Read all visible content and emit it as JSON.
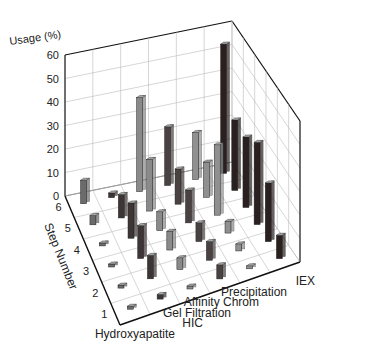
{
  "chart_data": {
    "type": "bar3d",
    "title": "",
    "zlabel": "Usage (%)",
    "ylabel": "Step Number",
    "xlabel": "",
    "z_ticks": [
      "0",
      "10",
      "20",
      "30",
      "40",
      "50",
      "60"
    ],
    "zlim": [
      0,
      60
    ],
    "y_ticks": [
      "1",
      "2",
      "3",
      "4",
      "5",
      "6"
    ],
    "categories": [
      "Hydroxyapatite",
      "HIC",
      "Gel Filtration",
      "Affinity Chrom",
      "Precipitation",
      "IEX"
    ],
    "series": [
      {
        "name": "Hydroxyapatite",
        "color": "#6b6b6b",
        "values": [
          1,
          1,
          1,
          1,
          4,
          10
        ]
      },
      {
        "name": "HIC",
        "color": "#3d3535",
        "values": [
          2,
          10,
          14,
          15,
          10,
          2
        ]
      },
      {
        "name": "Gel Filtration",
        "color": "#8a8a8a",
        "values": [
          1,
          5,
          8,
          8,
          22,
          40
        ]
      },
      {
        "name": "Affinity Chrom",
        "color": "#4a4242",
        "values": [
          6,
          8,
          8,
          14,
          15,
          25
        ]
      },
      {
        "name": "Precipitation",
        "color": "#909090",
        "values": [
          1,
          3,
          5,
          30,
          15,
          20
        ]
      },
      {
        "name": "IEX",
        "color": "#2a2020",
        "values": [
          10,
          25,
          35,
          30,
          30,
          55
        ]
      }
    ],
    "grid": true
  }
}
